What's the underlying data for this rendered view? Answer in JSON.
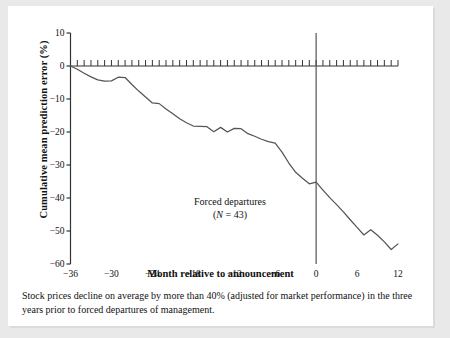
{
  "figure": {
    "caption": "Stock prices decline on average by more than 40% (adjusted for market performance) in the three years prior to forced departures of management."
  },
  "annotation": {
    "line1": "Forced departures",
    "line2_pre": "(",
    "line2_italic": "N",
    "line2_post": " = 43)",
    "line2_full": "(N = 43)"
  },
  "chart_data": {
    "type": "line",
    "title": "",
    "xlabel": "Month relative to announcement",
    "ylabel": "Cumulative mean prediction error (%)",
    "xlim": [
      -36,
      12
    ],
    "ylim": [
      -60,
      10
    ],
    "xticks": [
      -36,
      -30,
      -24,
      -18,
      -12,
      -6,
      0,
      6,
      12
    ],
    "xticklabels": [
      "−36",
      "−30",
      "−24",
      "−18",
      "−12",
      "−6",
      "0",
      "6",
      "12"
    ],
    "yticks": [
      10,
      0,
      -10,
      -20,
      -30,
      -40,
      -50,
      -60
    ],
    "yticklabels": [
      "10",
      "0",
      "−10",
      "−20",
      "−30",
      "−40",
      "−50",
      "−60"
    ],
    "grid": false,
    "legend": "none",
    "minor_xticks_step": 1,
    "reference_lines": [
      {
        "name": "zero-line",
        "orientation": "horizontal",
        "value": 0,
        "ticked": true
      },
      {
        "name": "event-line",
        "orientation": "vertical",
        "value": 0
      }
    ],
    "series": [
      {
        "name": "Forced departures (N = 43)",
        "color": "#555555",
        "x": [
          -36,
          -35,
          -34,
          -33,
          -32,
          -31,
          -30,
          -29,
          -28,
          -27,
          -26,
          -25,
          -24,
          -23,
          -22,
          -21,
          -20,
          -19,
          -18,
          -17,
          -16,
          -15,
          -14,
          -13,
          -12,
          -11,
          -10,
          -9,
          -8,
          -7,
          -6,
          -5,
          -4,
          -3,
          -2,
          -1,
          0,
          1,
          2,
          3,
          4,
          5,
          6,
          7,
          8,
          9,
          10,
          11,
          12
        ],
        "values": [
          0.0,
          -1.0,
          -2.2,
          -3.3,
          -4.2,
          -4.6,
          -4.5,
          -3.4,
          -3.5,
          -5.6,
          -7.6,
          -9.4,
          -11.2,
          -11.4,
          -13.0,
          -14.5,
          -16.0,
          -17.2,
          -18.2,
          -18.3,
          -18.4,
          -19.9,
          -18.6,
          -20.0,
          -18.9,
          -19.0,
          -20.5,
          -21.3,
          -22.2,
          -22.9,
          -23.4,
          -26.1,
          -29.4,
          -32.2,
          -34.0,
          -35.7,
          -35.2,
          -37.6,
          -39.9,
          -42.0,
          -44.2,
          -46.6,
          -48.9,
          -51.2,
          -49.6,
          -51.3,
          -53.3,
          -55.6,
          -53.9
        ]
      }
    ]
  }
}
